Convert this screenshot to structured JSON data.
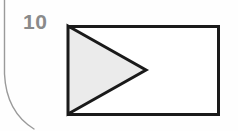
{
  "page": {
    "background_color": "#fefefe",
    "width": 238,
    "height": 131
  },
  "gutter": {
    "name": "page-binding-curve",
    "color": "#9a9a9a",
    "description": "curved scan shadow at left page edge"
  },
  "problem": {
    "number": "10"
  },
  "figure": {
    "caption": "",
    "rectangle": {
      "stroke_color": "#1a1a1a",
      "stroke_width": 3,
      "fill_color": "#ffffff",
      "x": 6,
      "y": 6,
      "width": 150,
      "height": 88
    },
    "triangle": {
      "stroke_color": "#1a1a1a",
      "stroke_width": 3,
      "fill_color": "#ebebeb",
      "points": "6,6 84,50 6,94",
      "orientation": "points-right",
      "vertices_label": [
        "top-left corner",
        "midpoint-right apex",
        "bottom-left corner"
      ]
    }
  }
}
